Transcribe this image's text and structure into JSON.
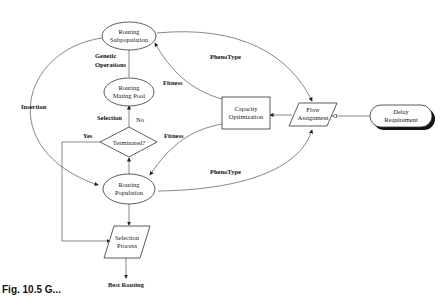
{
  "diagram": {
    "nodes": {
      "routing_subpopulation": {
        "line1": "Routing",
        "line2": "Subpopulation",
        "shape": "ellipse"
      },
      "routing_mating_pool": {
        "line1": "Routing",
        "line2": "Mating Pool",
        "shape": "ellipse"
      },
      "terminated": {
        "line1": "Terminated?",
        "shape": "diamond"
      },
      "routing_population": {
        "line1": "Routing",
        "line2": "Population",
        "shape": "ellipse"
      },
      "selection_process": {
        "line1": "Selection",
        "line2": "Process",
        "shape": "parallelogram"
      },
      "best_routing": {
        "line1": "Best Routing",
        "shape": "text"
      },
      "capacity_optimization": {
        "line1": "Capacity",
        "line2": "Optimization",
        "shape": "rectangle"
      },
      "flow_assignment": {
        "line1": "Flow",
        "line2": "Assignment",
        "shape": "parallelogram"
      },
      "delay_requirement": {
        "line1": "Delay",
        "line2": "Requirement",
        "shape": "rounded-rectangle"
      }
    },
    "edge_labels": {
      "genetic_operations_1": "Genetic",
      "genetic_operations_2": "Operations",
      "selection": "Selection",
      "no": "No",
      "yes": "Yes",
      "insertion": "Insertion",
      "fitness_top": "Fitness",
      "fitness_bottom": "Fitness",
      "phenotype_top": "PhenoType",
      "phenotype_bottom": "PhenoType"
    },
    "caption": "Fig. 10.5 G..."
  }
}
